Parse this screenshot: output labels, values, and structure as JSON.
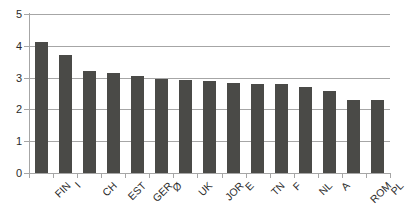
{
  "chart_data": {
    "type": "bar",
    "title": "",
    "subtitle": "",
    "xlabel": "",
    "ylabel": "",
    "categories": [
      "FIN",
      "I",
      "CH",
      "EST",
      "GER",
      "Ø",
      "UK",
      "JOR",
      "E",
      "TN",
      "F",
      "NL",
      "A",
      "ROM",
      "PL"
    ],
    "values": [
      4.12,
      3.71,
      3.2,
      3.15,
      3.06,
      2.97,
      2.91,
      2.89,
      2.82,
      2.79,
      2.79,
      2.71,
      2.59,
      2.3,
      2.29
    ],
    "series": [
      {
        "name": "",
        "values": [
          4.12,
          3.71,
          3.2,
          3.15,
          3.06,
          2.97,
          2.91,
          2.89,
          2.82,
          2.79,
          2.79,
          2.71,
          2.59,
          2.3,
          2.29
        ]
      }
    ],
    "ylim": [
      0,
      5
    ],
    "yticks": [
      0,
      1,
      2,
      3,
      4,
      5
    ],
    "ytick_labels": [
      "0",
      "1",
      "2",
      "3",
      "4",
      "5"
    ],
    "grid": true,
    "grid_axis": "y",
    "legend": false,
    "legend_position": "none",
    "bar_color": "#4a4a47",
    "grid_color": "#a6a6a6",
    "axis_color": "#a6a6a6",
    "background_color": "#ffffff",
    "xtick_label_rotation": -45,
    "annotations": []
  }
}
